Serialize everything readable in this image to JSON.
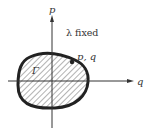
{
  "diagram": {
    "axes": {
      "vertical_label": "p",
      "horizontal_label": "q"
    },
    "annotation": "λ fixed",
    "point_label": "p, q",
    "region_label": "Γ",
    "colors": {
      "ink": "#222222",
      "hatch": "#555555",
      "background": "#ffffff"
    }
  }
}
